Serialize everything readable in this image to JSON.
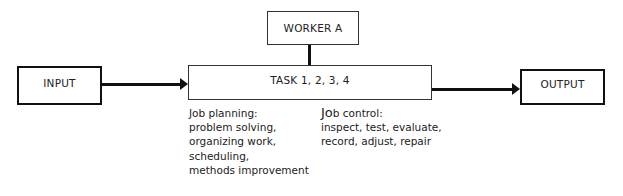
{
  "diagram": {
    "input": {
      "label": "INPUT"
    },
    "worker": {
      "label": "WORKER A"
    },
    "task": {
      "label": "TASK 1, 2, 3, 4"
    },
    "output": {
      "label": "OUTPUT"
    },
    "job_planning": {
      "heading": "Job planning:",
      "items": [
        "problem solving,",
        "organizing work,",
        "scheduling,",
        "methods improvement"
      ]
    },
    "job_control": {
      "heading_prefix": "Jo",
      "heading_rest": "b control:",
      "items": [
        "inspect, test, evaluate,",
        "record, adjust, repair"
      ]
    },
    "colors": {
      "line": "#111111",
      "background": "#ffffff",
      "text": "#222222"
    }
  }
}
